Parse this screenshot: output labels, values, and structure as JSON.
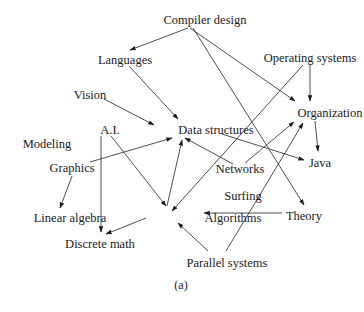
{
  "figure": {
    "caption": "(a)",
    "colors": {
      "text": "#1a1a1a",
      "edge": "#3a3a3a",
      "background": "#ffffff"
    }
  },
  "nodes": [
    {
      "id": "compiler",
      "label": "Compiler design",
      "x": 205,
      "y": 20
    },
    {
      "id": "languages",
      "label": "Languages",
      "x": 125,
      "y": 60
    },
    {
      "id": "os",
      "label": "Operating systems",
      "x": 310,
      "y": 58
    },
    {
      "id": "vision",
      "label": "Vision",
      "x": 90,
      "y": 95
    },
    {
      "id": "organization",
      "label": "Organization",
      "x": 330,
      "y": 113
    },
    {
      "id": "ai",
      "label": "A.I.",
      "x": 110,
      "y": 130
    },
    {
      "id": "datastructures",
      "label": "Data structures",
      "x": 216,
      "y": 130
    },
    {
      "id": "modeling",
      "label": "Modeling",
      "x": 47,
      "y": 144
    },
    {
      "id": "graphics",
      "label": "Graphics",
      "x": 72,
      "y": 168
    },
    {
      "id": "java",
      "label": "Java",
      "x": 320,
      "y": 163
    },
    {
      "id": "networks",
      "label": "Networks",
      "x": 240,
      "y": 169
    },
    {
      "id": "surfing",
      "label": "Surfing",
      "x": 243,
      "y": 196
    },
    {
      "id": "linalg",
      "label": "Linear algebra",
      "x": 70,
      "y": 218
    },
    {
      "id": "algorithms",
      "label": "Algorithms",
      "x": 233,
      "y": 218
    },
    {
      "id": "theory",
      "label": "Theory",
      "x": 304,
      "y": 216
    },
    {
      "id": "discrete",
      "label": "Discrete math",
      "x": 100,
      "y": 244
    },
    {
      "id": "parallel",
      "label": "Parallel systems",
      "x": 227,
      "y": 263
    }
  ],
  "edges": [
    {
      "from": "compiler",
      "to": "languages",
      "x1": 188,
      "y1": 28,
      "x2": 130,
      "y2": 50
    },
    {
      "from": "compiler",
      "to": "organization",
      "x1": 190,
      "y1": 28,
      "x2": 295,
      "y2": 101
    },
    {
      "from": "compiler",
      "to": "theory",
      "x1": 193,
      "y1": 28,
      "x2": 304,
      "y2": 205
    },
    {
      "from": "languages",
      "to": "datastructures",
      "x1": 129,
      "y1": 66,
      "x2": 178,
      "y2": 119
    },
    {
      "from": "vision",
      "to": "datastructures",
      "x1": 104,
      "y1": 99,
      "x2": 154,
      "y2": 125
    },
    {
      "from": "os",
      "to": "organization",
      "x1": 310,
      "y1": 64,
      "x2": 310,
      "y2": 101
    },
    {
      "from": "os",
      "to": "algorithms",
      "x1": 303,
      "y1": 65,
      "x2": 172,
      "y2": 211
    },
    {
      "from": "organization",
      "to": "java",
      "x1": 315,
      "y1": 121,
      "x2": 318,
      "y2": 151
    },
    {
      "from": "ai",
      "to": "algorithms",
      "x1": 111,
      "y1": 136,
      "x2": 166,
      "y2": 206
    },
    {
      "from": "ai",
      "to": "discrete",
      "x1": 101,
      "y1": 136,
      "x2": 101,
      "y2": 232
    },
    {
      "from": "graphics",
      "to": "datastructures",
      "x1": 90,
      "y1": 162,
      "x2": 172,
      "y2": 138
    },
    {
      "from": "graphics",
      "to": "linalg",
      "x1": 72,
      "y1": 176,
      "x2": 60,
      "y2": 208
    },
    {
      "from": "datastructures",
      "to": "java",
      "x1": 222,
      "y1": 134,
      "x2": 304,
      "y2": 160
    },
    {
      "from": "networks",
      "to": "datastructures",
      "x1": 233,
      "y1": 164,
      "x2": 185,
      "y2": 138
    },
    {
      "from": "networks",
      "to": "organization",
      "x1": 245,
      "y1": 163,
      "x2": 294,
      "y2": 122
    },
    {
      "from": "algorithms",
      "to": "datastructures",
      "x1": 167,
      "y1": 206,
      "x2": 182,
      "y2": 140
    },
    {
      "from": "algorithms",
      "to": "discrete",
      "x1": 146,
      "y1": 218,
      "x2": 106,
      "y2": 234
    },
    {
      "from": "theory",
      "to": "algorithms",
      "x1": 282,
      "y1": 213,
      "x2": 204,
      "y2": 213
    },
    {
      "from": "parallel",
      "to": "algorithms",
      "x1": 208,
      "y1": 251,
      "x2": 178,
      "y2": 223
    },
    {
      "from": "parallel",
      "to": "organization",
      "x1": 226,
      "y1": 251,
      "x2": 303,
      "y2": 123
    }
  ]
}
